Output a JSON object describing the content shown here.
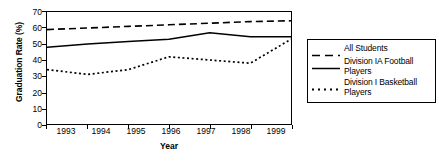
{
  "chart_data": {
    "type": "line",
    "title": "",
    "xlabel": "Year",
    "ylabel": "Graduation Rate (%)",
    "x": [
      1993,
      1994,
      1995,
      1996,
      1997,
      1998,
      1999
    ],
    "categories": [
      "1993",
      "1994",
      "1995",
      "1996",
      "1997",
      "1998",
      "1999"
    ],
    "xlim": [
      1993,
      1999
    ],
    "ylim": [
      0,
      70
    ],
    "yticks": [
      0,
      10,
      20,
      30,
      40,
      50,
      60,
      70
    ],
    "ytick_labels": [
      "0",
      "10",
      "20",
      "30",
      "40",
      "50",
      "60",
      "70"
    ],
    "grid": false,
    "legend_position": "right",
    "series": [
      {
        "name": "All Students",
        "style": "dashed",
        "values": [
          59,
          60,
          61,
          62,
          63,
          64,
          64.5
        ]
      },
      {
        "name": "Division IA Football Players",
        "style": "solid",
        "values": [
          48,
          50,
          51.5,
          53,
          57,
          54.5,
          54.5
        ]
      },
      {
        "name": "Division I Basketball Players",
        "style": "dotted",
        "values": [
          34,
          31,
          34,
          42,
          40,
          38,
          53
        ]
      }
    ],
    "legend": [
      {
        "label": "All Students",
        "style": "dashed"
      },
      {
        "label": "Division IA Football Players",
        "style": "solid"
      },
      {
        "label": "Division I Basketball Players",
        "style": "dotted"
      }
    ],
    "colors": {
      "line": "#000000",
      "axis": "#000000",
      "background": "#ffffff"
    }
  }
}
